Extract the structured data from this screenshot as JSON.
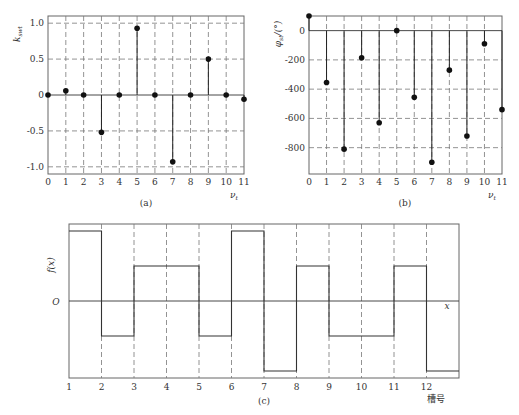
{
  "chart_data": [
    {
      "id": "a",
      "type": "scatter",
      "style": "stem",
      "caption": "(a)",
      "xlabel": "ν_t",
      "ylabel": "k_sw_t",
      "x": [
        0,
        1,
        2,
        3,
        4,
        5,
        6,
        7,
        8,
        9,
        10,
        11
      ],
      "values": [
        0,
        0.06,
        0,
        -0.52,
        0,
        0.93,
        0,
        -0.93,
        0,
        0.5,
        0,
        -0.06
      ],
      "xlim": [
        0,
        11
      ],
      "ylim": [
        -1.1,
        1.1
      ],
      "yticks": [
        "1.0",
        "0.5",
        "0",
        "-0.5",
        "-1.0"
      ],
      "ytick_values": [
        1.0,
        0.5,
        0,
        -0.5,
        -1.0
      ],
      "xticks": [
        "0",
        "1",
        "2",
        "3",
        "4",
        "5",
        "6",
        "7",
        "8",
        "9",
        "10",
        "11"
      ],
      "grid": true
    },
    {
      "id": "b",
      "type": "scatter",
      "style": "stem",
      "caption": "(b)",
      "xlabel": "ν_t",
      "ylabel": "φ_st/(°)",
      "x": [
        0,
        1,
        2,
        3,
        4,
        5,
        6,
        7,
        8,
        9,
        10,
        11
      ],
      "values": [
        100,
        -355,
        -810,
        -185,
        -630,
        0,
        -455,
        -900,
        -270,
        -720,
        -90,
        -540
      ],
      "xlim": [
        0,
        11
      ],
      "ylim": [
        -980,
        100
      ],
      "yticks": [
        "0",
        "-200",
        "-400",
        "-600",
        "-800"
      ],
      "ytick_values": [
        0,
        -200,
        -400,
        -600,
        -800
      ],
      "xticks": [
        "0",
        "1",
        "2",
        "3",
        "4",
        "5",
        "6",
        "7",
        "8",
        "9",
        "10",
        "11"
      ],
      "grid": true
    },
    {
      "id": "c",
      "type": "line",
      "style": "step",
      "caption": "(c)",
      "xlabel": "槽号",
      "ylabel": "f(x)",
      "origin_label": "O",
      "axis_label_x": "x",
      "xticks": [
        "1",
        "2",
        "3",
        "4",
        "5",
        "6",
        "7",
        "8",
        "9",
        "10",
        "11",
        "12"
      ],
      "segments": [
        {
          "from": 1,
          "to": 2,
          "level": 2
        },
        {
          "from": 2,
          "to": 3,
          "level": -1
        },
        {
          "from": 3,
          "to": 5,
          "level": 1
        },
        {
          "from": 5,
          "to": 6,
          "level": -1
        },
        {
          "from": 6,
          "to": 7,
          "level": 2
        },
        {
          "from": 7,
          "to": 8,
          "level": -2
        },
        {
          "from": 8,
          "to": 9,
          "level": 1
        },
        {
          "from": 9,
          "to": 11,
          "level": -1
        },
        {
          "from": 11,
          "to": 12,
          "level": 1
        },
        {
          "from": 12,
          "to": 13,
          "level": -2
        }
      ],
      "grid": "vertical-dashed"
    }
  ]
}
